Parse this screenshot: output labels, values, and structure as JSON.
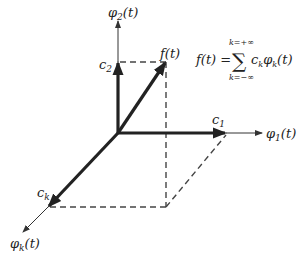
{
  "diagram": {
    "type": "vector-space-basis-decomposition",
    "colors": {
      "ink": "#222222",
      "thin": "#333333",
      "dash": "#444444",
      "background": "#ffffff"
    },
    "origin": [
      118,
      133
    ],
    "axes": [
      {
        "id": "phi1",
        "label": "φ1(t)",
        "base": "φ",
        "sub": "1",
        "arg": "(t)",
        "end": [
          262,
          133
        ]
      },
      {
        "id": "phi2",
        "label": "φ2(t)",
        "base": "φ",
        "sub": "2",
        "arg": "(t)",
        "end": [
          118,
          20
        ]
      },
      {
        "id": "phik",
        "label": "φk(t)",
        "base": "φ",
        "sub": "k",
        "arg": "(t)",
        "end": [
          22,
          233
        ]
      }
    ],
    "components": [
      {
        "id": "c1",
        "label": "c1",
        "base": "c",
        "sub": "1",
        "tip": [
          226,
          133
        ]
      },
      {
        "id": "c2",
        "label": "c2",
        "base": "c",
        "sub": "2",
        "tip": [
          118,
          62
        ]
      },
      {
        "id": "ck",
        "label": "ck",
        "base": "c",
        "sub": "k",
        "tip": [
          48,
          207
        ]
      }
    ],
    "vector": {
      "id": "f",
      "label": "f(t)",
      "tip": [
        166,
        62
      ]
    },
    "formula": {
      "lhs": "f(t) =",
      "sum_symbol": "∑",
      "upper_limit": "k=+∞",
      "lower_limit": "k=−∞",
      "term": "c",
      "term_sub": "k",
      "term_phi": "φ",
      "term_phi_sub": "k",
      "term_arg": "(t)",
      "full_text": "f(t) = Σ_{k=−∞}^{k=+∞} c_k φ_k(t)"
    }
  }
}
